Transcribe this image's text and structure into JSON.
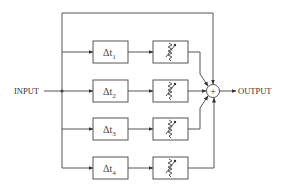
{
  "diagram": {
    "type": "block-diagram",
    "input_label": "INPUT",
    "output_label": "OUTPUT",
    "summer_symbol": "+",
    "direct_path": true,
    "branches": [
      {
        "delay_symbol": "Δt",
        "subscript": "1",
        "attenuator": "variable-attenuator"
      },
      {
        "delay_symbol": "Δt",
        "subscript": "2",
        "attenuator": "variable-attenuator"
      },
      {
        "delay_symbol": "Δt",
        "subscript": "3",
        "attenuator": "variable-attenuator"
      },
      {
        "delay_symbol": "Δt",
        "subscript": "4",
        "attenuator": "variable-attenuator"
      }
    ],
    "colors": {
      "line": "#555555",
      "text": "#333333",
      "background": "#ffffff"
    }
  }
}
